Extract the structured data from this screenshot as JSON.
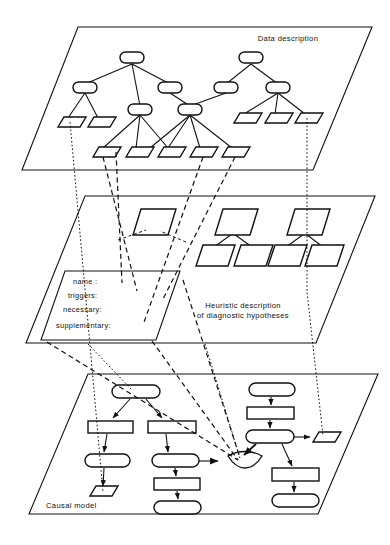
{
  "figure": {
    "kind": "three-layer-knowledge-architecture-diagram",
    "background": "#ffffff",
    "ink": "#111111"
  },
  "layers": [
    {
      "id": "data-description",
      "label": "Data description",
      "label_pos": {
        "x": 288,
        "y": 41
      },
      "plane": "78,27 372,27 313,170 22,170",
      "node_shape_parent": "rounded-rect",
      "node_shape_leaf": "parallelogram"
    },
    {
      "id": "heuristic-description",
      "label_line1": "Heuristic  description",
      "label_line2": "of diagnostic hypotheses",
      "label_pos": {
        "x": 243,
        "y": 308
      },
      "plane": "85,196 375,196 316,343 26,343",
      "node_shape": "parallelogram"
    },
    {
      "id": "causal-model",
      "label": "Causal model",
      "label_pos": {
        "x": 60,
        "y": 508
      },
      "plane": "88,374 378,374 318,514 29,514",
      "node_shapes": [
        "stadium",
        "rectangle",
        "parallelogram",
        "or-gate"
      ]
    }
  ],
  "frame": {
    "id": "hypothesis-frame",
    "shape": "parallelogram",
    "outline": "65,271 180,271 156,340 41,340",
    "slots": [
      {
        "label": "name :",
        "x": 73,
        "y": 283
      },
      {
        "label": "triggers:",
        "x": 68,
        "y": 296
      },
      {
        "label": "necessary:",
        "x": 63,
        "y": 310
      },
      {
        "label": "supplementary:",
        "x": 55,
        "y": 326
      }
    ]
  },
  "top_layer_nodes": {
    "parents": [
      {
        "id": "t-root-a",
        "x": 132,
        "y": 59
      },
      {
        "id": "t-root-b",
        "x": 251,
        "y": 59
      },
      {
        "id": "t-a1",
        "x": 85,
        "y": 88
      },
      {
        "id": "t-a2",
        "x": 170,
        "y": 88
      },
      {
        "id": "t-b1",
        "x": 226,
        "y": 88
      },
      {
        "id": "t-b2",
        "x": 278,
        "y": 88
      },
      {
        "id": "t-a3",
        "x": 140,
        "y": 110
      },
      {
        "id": "t-a4",
        "x": 190,
        "y": 110
      }
    ],
    "leaves": [
      {
        "id": "t-l1",
        "x": 68,
        "y": 122
      },
      {
        "id": "t-l2",
        "x": 98,
        "y": 122
      },
      {
        "id": "t-l3",
        "x": 244,
        "y": 118
      },
      {
        "id": "t-l4",
        "x": 275,
        "y": 118
      },
      {
        "id": "t-l5",
        "x": 305,
        "y": 118
      },
      {
        "id": "t-l6",
        "x": 103,
        "y": 152
      },
      {
        "id": "t-l7",
        "x": 136,
        "y": 152
      },
      {
        "id": "t-l8",
        "x": 168,
        "y": 152
      },
      {
        "id": "t-l9",
        "x": 200,
        "y": 152
      },
      {
        "id": "t-l10",
        "x": 232,
        "y": 152
      }
    ]
  },
  "middle_layer_nodes": {
    "parents": [
      {
        "id": "m-p1",
        "x": 152,
        "y": 222
      },
      {
        "id": "m-p2",
        "x": 234,
        "y": 222
      },
      {
        "id": "m-p3",
        "x": 306,
        "y": 222
      },
      {
        "id": "m-c1",
        "x": 214,
        "y": 252
      },
      {
        "id": "m-c2",
        "x": 252,
        "y": 252
      },
      {
        "id": "m-c3",
        "x": 286,
        "y": 252
      },
      {
        "id": "m-c4",
        "x": 323,
        "y": 252
      }
    ]
  },
  "causal_nodes": {
    "column_a": [
      "stadium",
      "rectangle",
      "stadium",
      "parallelogram"
    ],
    "column_b": [
      "rectangle",
      "stadium",
      "rectangle",
      "stadium"
    ],
    "column_c": [
      "stadium",
      "rectangle",
      "stadium",
      "rectangle",
      "stadium"
    ],
    "output": "parallelogram",
    "gate": "or-gate"
  },
  "link_styles": {
    "tree_edge": "solid",
    "interlayer_dotted": "dotted",
    "interlayer_dashed": "dashed",
    "causal_arrow": "solid-arrow",
    "activation_arrow": "thick-arrow"
  }
}
